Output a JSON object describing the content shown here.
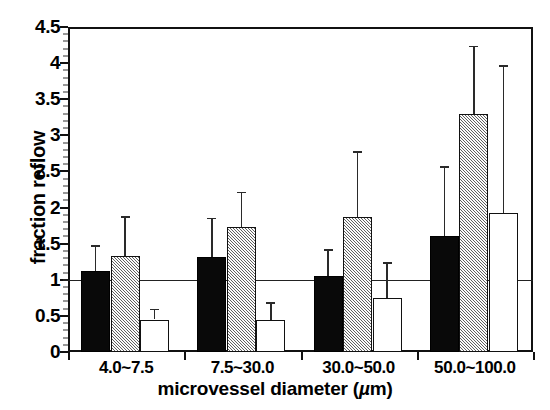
{
  "chart_data": {
    "type": "bar",
    "title": "",
    "xlabel": "microvessel diameter  (µm)",
    "ylabel": "fraction reflow",
    "categories": [
      "4.0~7.5",
      "7.5~30.0",
      "30.0~50.0",
      "50.0~100.0"
    ],
    "ylim": [
      0,
      4.5
    ],
    "y_ticks": [
      "0",
      "0.5",
      "1",
      "1.5",
      "2",
      "2.5",
      "3",
      "3.5",
      "4",
      "4.5"
    ],
    "y_tick_values": [
      0,
      0.5,
      1,
      1.5,
      2,
      2.5,
      3,
      3.5,
      4,
      4.5
    ],
    "grid": false,
    "reference_line": 1,
    "legend": [],
    "legend_position": "none",
    "series": [
      {
        "name": "series-1-solid-black",
        "fill": "solid-black",
        "color": "#090909",
        "values": [
          1.12,
          1.31,
          1.05,
          1.6
        ],
        "errors_upper": [
          1.48,
          1.86,
          1.42,
          2.57
        ]
      },
      {
        "name": "series-2-hatched-gray",
        "fill": "hatched-gray",
        "color": "#b9b9b9",
        "values": [
          1.33,
          1.73,
          1.87,
          3.3
        ],
        "errors_upper": [
          1.88,
          2.22,
          2.78,
          4.24
        ]
      },
      {
        "name": "series-3-open-white",
        "fill": "open-white",
        "color": "#ffffff",
        "values": [
          0.45,
          0.44,
          0.75,
          1.92
        ],
        "errors_upper": [
          0.6,
          0.69,
          1.24,
          3.97
        ]
      }
    ]
  },
  "axis": {
    "y_title": "fraction reflow",
    "x_title_main": "microvessel diameter  (",
    "x_title_unit": "µ",
    "x_title_tail": "m)"
  }
}
